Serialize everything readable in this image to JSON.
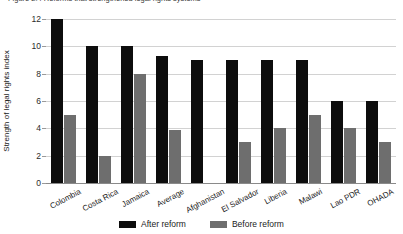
{
  "caption": "Figure 2.4  Reforms that strengthened legal rights systems",
  "chart_data": {
    "type": "bar",
    "title": "",
    "xlabel": "",
    "ylabel": "Strength of legal rights index",
    "ylim": [
      0,
      12
    ],
    "yticks": [
      0,
      2,
      4,
      6,
      8,
      10,
      12
    ],
    "grid": true,
    "legend_position": "bottom-center",
    "categories": [
      "Colombia",
      "Costa Rica",
      "Jamaica",
      "Average",
      "Afghanistan",
      "El Salvador",
      "Liberia",
      "Malawi",
      "Lao PDR",
      "OHADA"
    ],
    "series": [
      {
        "name": "After reform",
        "color": "#0d0d0d",
        "values": [
          12,
          10,
          10,
          9.3,
          9,
          9,
          9,
          9,
          6,
          6
        ]
      },
      {
        "name": "Before reform",
        "color": "#6e6e6e",
        "values": [
          5,
          2,
          8,
          3.9,
          0,
          3,
          4,
          5,
          4,
          3
        ]
      }
    ]
  }
}
